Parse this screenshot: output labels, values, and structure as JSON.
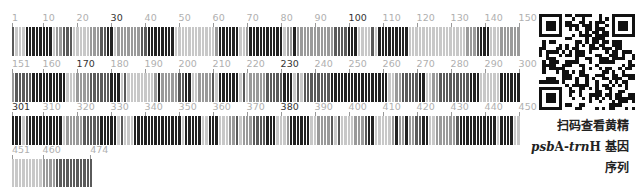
{
  "barcode": {
    "total_length": 474,
    "bases_per_row": 150,
    "colors": {
      "A": "#222222",
      "C": "#5a5a5a",
      "G": "#9a9a9a",
      "T": "#c8c8c8"
    },
    "rows": [
      {
        "start": 1,
        "end": 150,
        "ticks": [
          {
            "label": "1",
            "pos": 1,
            "dark": false
          },
          {
            "label": "10",
            "pos": 10,
            "dark": false
          },
          {
            "label": "20",
            "pos": 20,
            "dark": false
          },
          {
            "label": "30",
            "pos": 30,
            "dark": true
          },
          {
            "label": "40",
            "pos": 40,
            "dark": false
          },
          {
            "label": "50",
            "pos": 50,
            "dark": false
          },
          {
            "label": "60",
            "pos": 60,
            "dark": false
          },
          {
            "label": "70",
            "pos": 70,
            "dark": false
          },
          {
            "label": "80",
            "pos": 80,
            "dark": false
          },
          {
            "label": "90",
            "pos": 90,
            "dark": false
          },
          {
            "label": "100",
            "pos": 100,
            "dark": true
          },
          {
            "label": "110",
            "pos": 110,
            "dark": false
          },
          {
            "label": "120",
            "pos": 120,
            "dark": false
          },
          {
            "label": "130",
            "pos": 130,
            "dark": false
          },
          {
            "label": "140",
            "pos": 140,
            "dark": false
          },
          {
            "label": "150",
            "pos": 150,
            "dark": false
          }
        ]
      },
      {
        "start": 151,
        "end": 300,
        "ticks": [
          {
            "label": "151",
            "pos": 151,
            "dark": false
          },
          {
            "label": "160",
            "pos": 160,
            "dark": false
          },
          {
            "label": "170",
            "pos": 170,
            "dark": true
          },
          {
            "label": "180",
            "pos": 180,
            "dark": false
          },
          {
            "label": "190",
            "pos": 190,
            "dark": false
          },
          {
            "label": "200",
            "pos": 200,
            "dark": false
          },
          {
            "label": "210",
            "pos": 210,
            "dark": false
          },
          {
            "label": "220",
            "pos": 220,
            "dark": false
          },
          {
            "label": "230",
            "pos": 230,
            "dark": true
          },
          {
            "label": "240",
            "pos": 240,
            "dark": false
          },
          {
            "label": "250",
            "pos": 250,
            "dark": false
          },
          {
            "label": "260",
            "pos": 260,
            "dark": false
          },
          {
            "label": "270",
            "pos": 270,
            "dark": false
          },
          {
            "label": "280",
            "pos": 280,
            "dark": false
          },
          {
            "label": "290",
            "pos": 290,
            "dark": false
          },
          {
            "label": "300",
            "pos": 300,
            "dark": false
          }
        ]
      },
      {
        "start": 301,
        "end": 450,
        "ticks": [
          {
            "label": "301",
            "pos": 301,
            "dark": true
          },
          {
            "label": "310",
            "pos": 310,
            "dark": false
          },
          {
            "label": "320",
            "pos": 320,
            "dark": false
          },
          {
            "label": "330",
            "pos": 330,
            "dark": false
          },
          {
            "label": "340",
            "pos": 340,
            "dark": false
          },
          {
            "label": "350",
            "pos": 350,
            "dark": false
          },
          {
            "label": "360",
            "pos": 360,
            "dark": false
          },
          {
            "label": "370",
            "pos": 370,
            "dark": false
          },
          {
            "label": "380",
            "pos": 380,
            "dark": true
          },
          {
            "label": "390",
            "pos": 390,
            "dark": false
          },
          {
            "label": "400",
            "pos": 400,
            "dark": false
          },
          {
            "label": "410",
            "pos": 410,
            "dark": false
          },
          {
            "label": "420",
            "pos": 420,
            "dark": false
          },
          {
            "label": "430",
            "pos": 430,
            "dark": false
          },
          {
            "label": "440",
            "pos": 440,
            "dark": false
          },
          {
            "label": "450",
            "pos": 450,
            "dark": false
          }
        ]
      },
      {
        "start": 451,
        "end": 474,
        "ticks": [
          {
            "label": "451",
            "pos": 451,
            "dark": false
          },
          {
            "label": "460",
            "pos": 460,
            "dark": false
          },
          {
            "label": "474",
            "pos": 474,
            "dark": false
          }
        ]
      }
    ]
  },
  "qr_code": {
    "label": "qr-code"
  },
  "caption": {
    "line1": "扫码查看黄精",
    "line2_gene_italic": "psb",
    "line2_gene_a": "A-",
    "line2_gene_italic2": "trn",
    "line2_gene_h": "H",
    "line2_suffix": " 基因",
    "line3": "序列"
  }
}
